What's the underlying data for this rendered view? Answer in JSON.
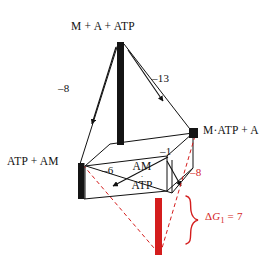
{
  "figure": {
    "type": "thermodynamic-cycle-diagram",
    "title": "",
    "colors": {
      "line": "#111111",
      "bar_black": "#141414",
      "red": "#d41d1d",
      "background": "#ffffff"
    },
    "nodes": [
      {
        "id": "top",
        "label": "M + A + ATP",
        "x": 120,
        "y": 42
      },
      {
        "id": "right",
        "label": "M·ATP + A",
        "x": 196,
        "y": 132
      },
      {
        "id": "left",
        "label": "ATP + AM",
        "x": 81,
        "y": 163
      },
      {
        "id": "front-center",
        "label_line1": "AM",
        "label_mid": "·",
        "label_line2": "ATP",
        "x": 140,
        "y": 178
      }
    ],
    "edge_labels": [
      {
        "id": "top-to-left",
        "text": "–8",
        "color": "black"
      },
      {
        "id": "top-to-right",
        "text": "–13",
        "color": "black"
      },
      {
        "id": "left-to-amatp",
        "text": "–6",
        "color": "black"
      },
      {
        "id": "right-to-amatp",
        "text": "–1",
        "color": "black"
      },
      {
        "id": "right-down-dashed",
        "text": "–8",
        "color": "red"
      }
    ],
    "bracket": {
      "text_delta": "Δ",
      "text_g": "G",
      "text_sub": "1",
      "text_eq": " = 7",
      "full_text": "ΔG₁ = 7",
      "color": "#d41d1d"
    },
    "bars": [
      {
        "id": "bar-top",
        "color": "#141414",
        "x": 117,
        "y": 42,
        "w": 7,
        "h": 103
      },
      {
        "id": "bar-left",
        "color": "#141414",
        "x": 78,
        "y": 163,
        "w": 6,
        "h": 36
      },
      {
        "id": "bar-right",
        "color": "#141414",
        "x": 190,
        "y": 129,
        "w": 8,
        "h": 9
      },
      {
        "id": "bar-red",
        "color": "#d41d1d",
        "x": 155,
        "y": 198,
        "w": 7,
        "h": 57
      }
    ]
  }
}
